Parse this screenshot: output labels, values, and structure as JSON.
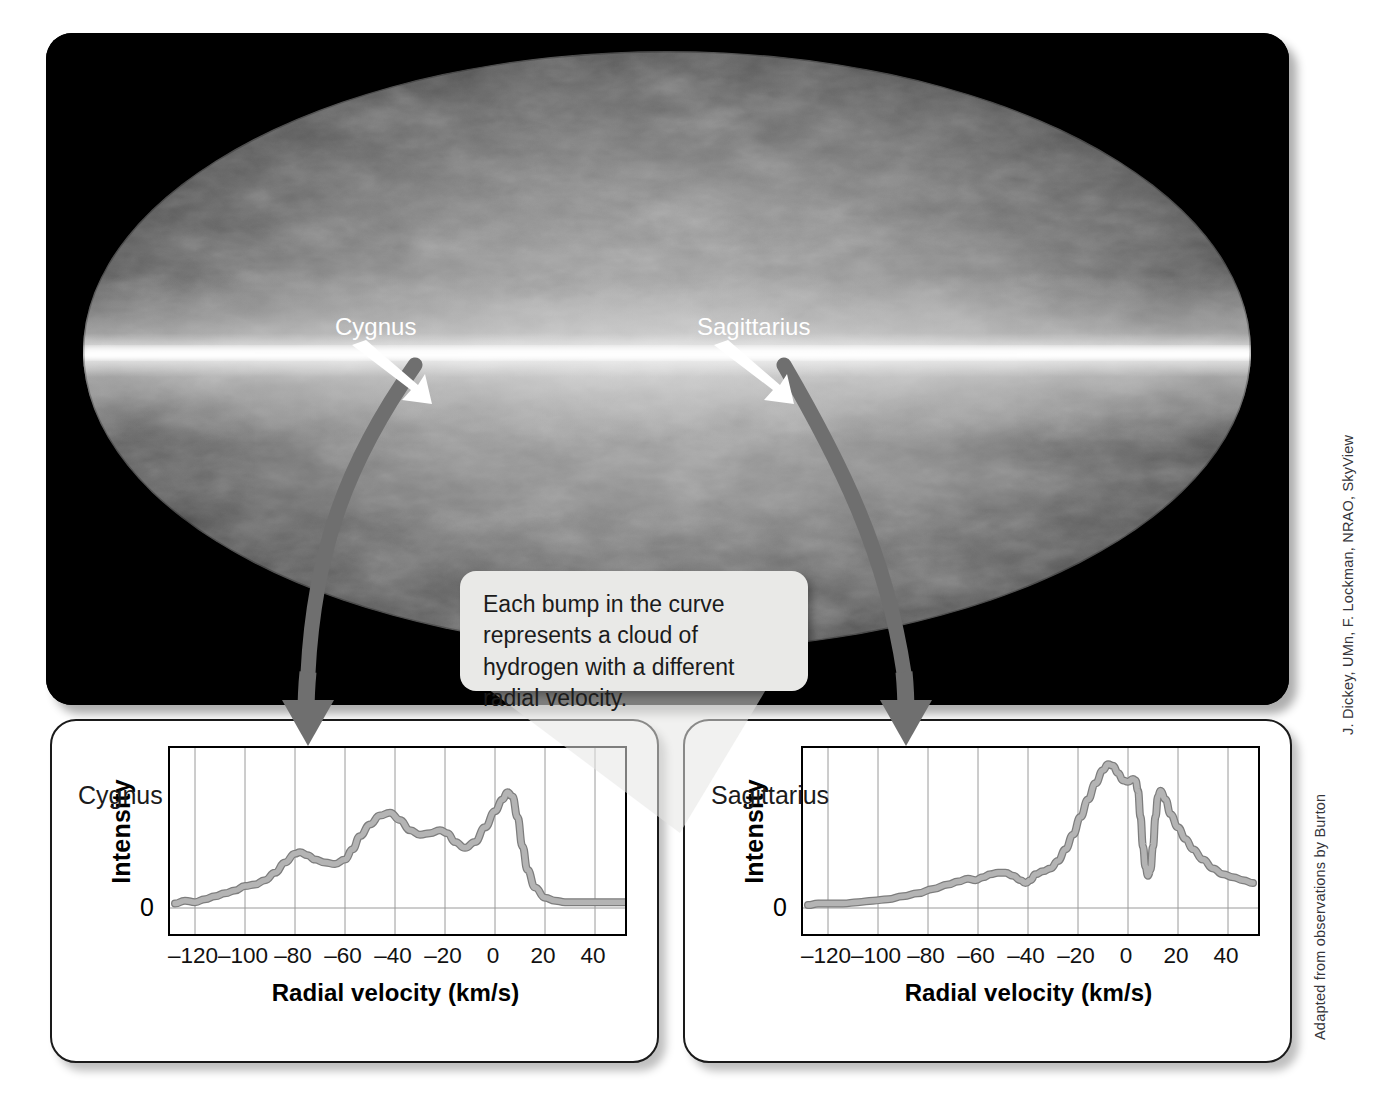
{
  "skymap": {
    "title": "All-sky 21-cm map of neutral\nhydrogen in our galaxy",
    "markers": [
      {
        "label": "Cygnus",
        "label_x": 289,
        "label_y": 294,
        "tip_x": 408,
        "tip_y": 365
      },
      {
        "label": "Sagittarius",
        "label_x": 651,
        "label_y": 294,
        "tip_x": 766,
        "tip_y": 365
      }
    ]
  },
  "callout": {
    "text": "Each bump in the curve represents a cloud of hydrogen with a different radial velocity."
  },
  "credits": {
    "map": "J. Dickey, UMn, F. Lockman, NRAO, SkyView",
    "source": "Adapted from observations by Burton"
  },
  "axis": {
    "ylabel": "Intensity",
    "zero_label": "0",
    "xlabel": "Radial velocity (km/s)",
    "xticks": [
      -120,
      -100,
      -80,
      -60,
      -40,
      -20,
      0,
      20,
      40
    ]
  },
  "chart_data": [
    {
      "type": "line",
      "title": "Cygnus",
      "xlabel": "Radial velocity (km/s)",
      "ylabel": "Intensity",
      "xlim": [
        -130,
        52
      ],
      "ylim": [
        0,
        1.05
      ],
      "xticks": [
        -120,
        -100,
        -80,
        -60,
        -40,
        -20,
        0,
        20,
        40
      ],
      "grid": true,
      "series_color": "#b4b4b4",
      "x": [
        -128,
        -124,
        -120,
        -116,
        -112,
        -108,
        -104,
        -100,
        -96,
        -92,
        -88,
        -84,
        -80,
        -78,
        -75,
        -72,
        -68,
        -64,
        -60,
        -57,
        -54,
        -50,
        -46,
        -42,
        -38,
        -34,
        -30,
        -26,
        -22,
        -19,
        -16,
        -12,
        -8,
        -4,
        0,
        3,
        5,
        7,
        9,
        11,
        13,
        16,
        20,
        24,
        28,
        34,
        40,
        46,
        52
      ],
      "y": [
        0.03,
        0.05,
        0.04,
        0.06,
        0.08,
        0.1,
        0.12,
        0.15,
        0.16,
        0.19,
        0.24,
        0.31,
        0.37,
        0.38,
        0.36,
        0.33,
        0.31,
        0.3,
        0.33,
        0.4,
        0.49,
        0.57,
        0.63,
        0.65,
        0.6,
        0.53,
        0.5,
        0.51,
        0.53,
        0.51,
        0.45,
        0.41,
        0.45,
        0.55,
        0.66,
        0.74,
        0.79,
        0.76,
        0.62,
        0.42,
        0.26,
        0.14,
        0.07,
        0.05,
        0.04,
        0.04,
        0.04,
        0.04,
        0.04
      ]
    },
    {
      "type": "line",
      "title": "Sagittarius",
      "xlabel": "Radial velocity (km/s)",
      "ylabel": "Intensity",
      "xlim": [
        -130,
        52
      ],
      "ylim": [
        0,
        1.05
      ],
      "xticks": [
        -120,
        -100,
        -80,
        -60,
        -40,
        -20,
        0,
        20,
        40
      ],
      "grid": true,
      "series_color": "#b4b4b4",
      "x": [
        -128,
        -124,
        -120,
        -114,
        -108,
        -102,
        -96,
        -90,
        -84,
        -78,
        -72,
        -68,
        -64,
        -61,
        -58,
        -55,
        -52,
        -49,
        -46,
        -43,
        -41,
        -39,
        -37,
        -34,
        -31,
        -28,
        -25,
        -22,
        -19,
        -16,
        -13,
        -10,
        -8,
        -6,
        -4,
        -2,
        0,
        2,
        3,
        4,
        5,
        6,
        7,
        8,
        9,
        10,
        11,
        12,
        13,
        15,
        17,
        20,
        23,
        26,
        30,
        34,
        38,
        42,
        46,
        50
      ],
      "y": [
        0.02,
        0.03,
        0.03,
        0.03,
        0.04,
        0.05,
        0.06,
        0.08,
        0.1,
        0.13,
        0.16,
        0.18,
        0.2,
        0.19,
        0.21,
        0.23,
        0.24,
        0.24,
        0.22,
        0.19,
        0.17,
        0.19,
        0.23,
        0.25,
        0.27,
        0.32,
        0.4,
        0.5,
        0.62,
        0.74,
        0.85,
        0.94,
        0.98,
        0.97,
        0.92,
        0.87,
        0.86,
        0.88,
        0.87,
        0.8,
        0.62,
        0.42,
        0.28,
        0.22,
        0.26,
        0.42,
        0.62,
        0.76,
        0.8,
        0.74,
        0.64,
        0.55,
        0.47,
        0.4,
        0.33,
        0.27,
        0.23,
        0.21,
        0.19,
        0.17
      ]
    }
  ]
}
